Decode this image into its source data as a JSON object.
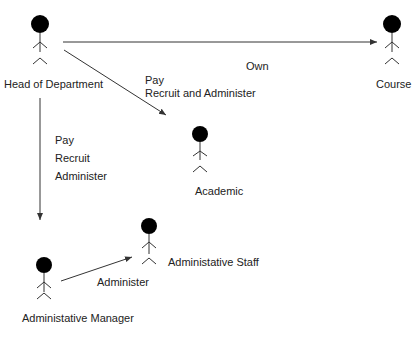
{
  "actors": [
    {
      "id": "head",
      "label": "Head of Department"
    },
    {
      "id": "course",
      "label": "Course"
    },
    {
      "id": "academic",
      "label": "Academic"
    },
    {
      "id": "manager",
      "label": "Administative Manager"
    },
    {
      "id": "staff",
      "label": "Administative Staff"
    }
  ],
  "associations": {
    "own": "Own",
    "academic_pay": "Pay",
    "academic_recruit": "Recruit and Administer",
    "manager_pay": "Pay",
    "manager_recruit": "Recruit",
    "manager_administer": "Administer",
    "staff_administer": "Administer"
  },
  "colors": {
    "line": "#333333",
    "head": "#000000"
  }
}
